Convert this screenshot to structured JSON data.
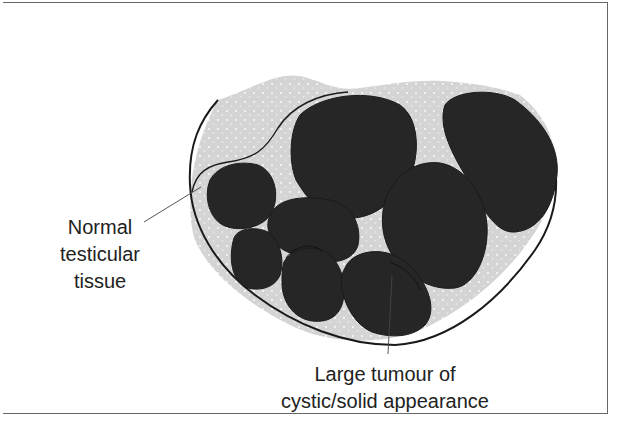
{
  "figure": {
    "type": "anatomical-schematic",
    "colors": {
      "tissue_fill": "#d4d4d4",
      "tissue_dots": "#ffffff",
      "tumour_fill": "#262626",
      "outline": "#1a1a1a",
      "leader_line": "#444444",
      "frame": "#666666",
      "text": "#222222"
    },
    "nodule_count": 8
  },
  "labels": {
    "normal_tissue": {
      "lines": [
        "Normal",
        "testicular",
        "tissue"
      ]
    },
    "tumour": {
      "lines": [
        "Large tumour of",
        "cystic/solid appearance"
      ]
    }
  }
}
